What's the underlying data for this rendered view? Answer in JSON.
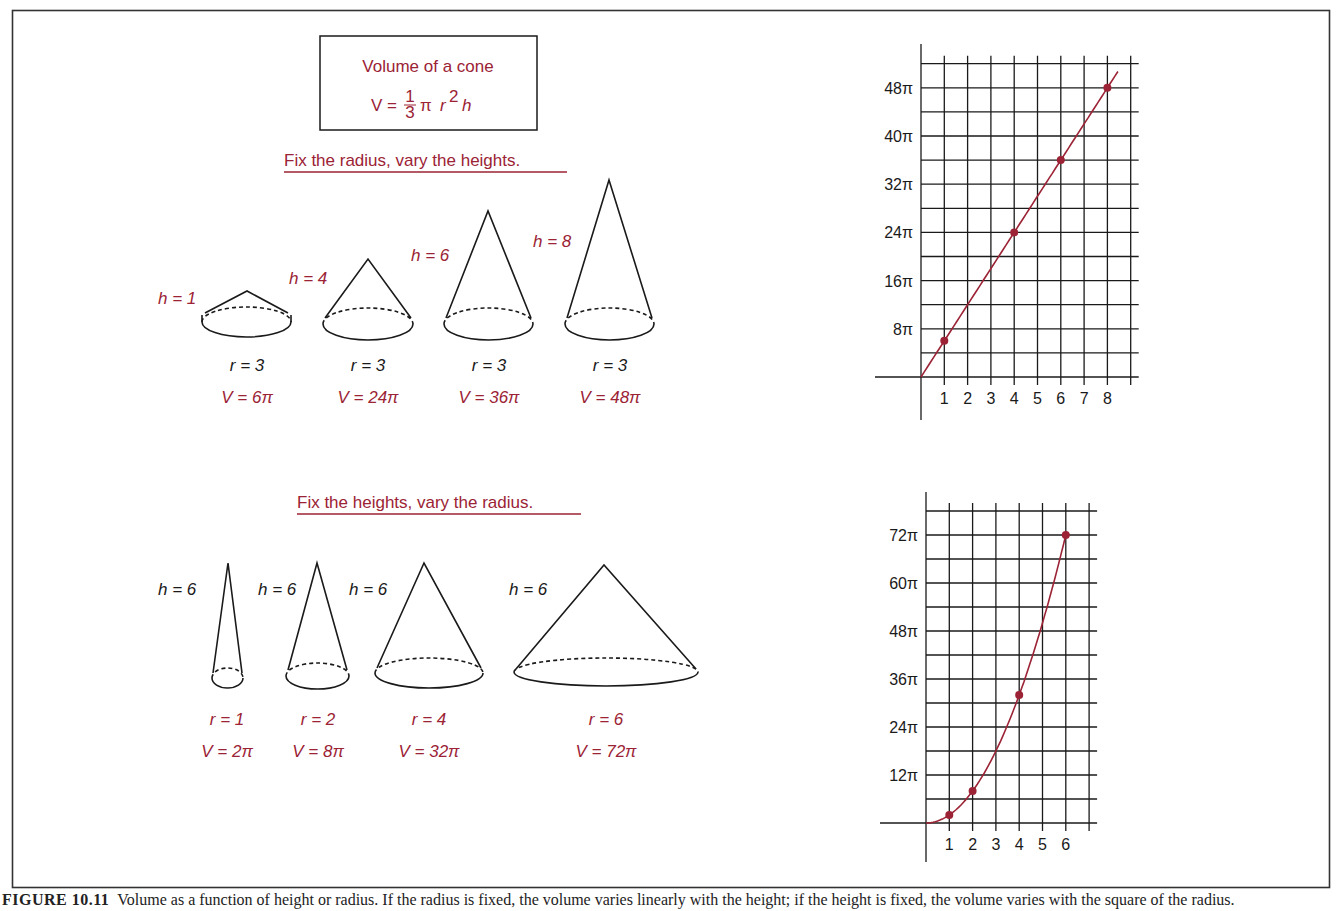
{
  "colors": {
    "accent": "#9b2335",
    "ink": "#1a1a1a",
    "grid": "#1a1a1a",
    "frame": "#333333"
  },
  "formula_box": {
    "title": "Volume of a cone",
    "formula_lhs": "V =",
    "formula_frac_num": "1",
    "formula_frac_den": "3",
    "formula_pi": "π",
    "formula_r": "r",
    "formula_exp": "2",
    "formula_h": "h"
  },
  "section_top": {
    "heading": "Fix the radius, vary the heights.",
    "cones": [
      {
        "h_label": "h = 1",
        "r_label": "r = 3",
        "v_label": "V = 6π"
      },
      {
        "h_label": "h = 4",
        "r_label": "r = 3",
        "v_label": "V = 24π"
      },
      {
        "h_label": "h = 6",
        "r_label": "r = 3",
        "v_label": "V = 36π"
      },
      {
        "h_label": "h = 8",
        "r_label": "r = 3",
        "v_label": "V = 48π"
      }
    ]
  },
  "section_bottom": {
    "heading": "Fix the heights, vary the radius.",
    "cones": [
      {
        "h_label": "h = 6",
        "r_label": "r = 1",
        "v_label": "V = 2π"
      },
      {
        "h_label": "h = 6",
        "r_label": "r = 2",
        "v_label": "V = 8π"
      },
      {
        "h_label": "h = 6",
        "r_label": "r = 4",
        "v_label": "V = 32π"
      },
      {
        "h_label": "h = 6",
        "r_label": "r = 6",
        "v_label": "V = 72π"
      }
    ]
  },
  "caption": {
    "figure": "FIGURE 10.11",
    "text": "Volume as a function of height or radius. If the radius is fixed, the volume varies linearly with the height; if the height is fixed, the volume varies with the square of the radius."
  },
  "chart_data": [
    {
      "type": "line",
      "title": "Fix the radius, vary the heights (r = 3)",
      "xlabel": "h",
      "ylabel": "V",
      "x_ticks": [
        "1",
        "2",
        "3",
        "4",
        "5",
        "6",
        "7",
        "8"
      ],
      "y_ticks": [
        "8π",
        "16π",
        "24π",
        "32π",
        "40π",
        "48π"
      ],
      "x": [
        1,
        4,
        6,
        8
      ],
      "values": [
        6,
        24,
        36,
        48
      ],
      "value_unit": "π",
      "curve": "linear, V = 6πh",
      "xlim": [
        0,
        9
      ],
      "ylim": [
        0,
        52
      ],
      "grid": true
    },
    {
      "type": "line",
      "title": "Fix the heights, vary the radius (h = 6)",
      "xlabel": "r",
      "ylabel": "V",
      "x_ticks": [
        "1",
        "2",
        "3",
        "4",
        "5",
        "6"
      ],
      "y_ticks": [
        "12π",
        "24π",
        "36π",
        "48π",
        "60π",
        "72π"
      ],
      "x": [
        1,
        2,
        4,
        6
      ],
      "values": [
        2,
        8,
        32,
        72
      ],
      "value_unit": "π",
      "curve": "quadratic, V = 2πr²",
      "xlim": [
        0,
        7
      ],
      "ylim": [
        0,
        78
      ],
      "grid": true
    }
  ]
}
